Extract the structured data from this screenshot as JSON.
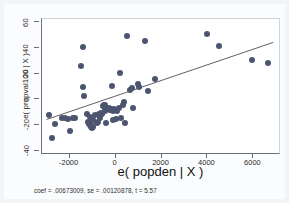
{
  "chart_data": {
    "type": "scatter",
    "title": "",
    "subtitle": "",
    "xlabel": "e( popden | X )",
    "ylabel": "e( propval100 | X )",
    "caption": "coef = .00673009, se = .00120878, t = 5.57",
    "xlim": [
      -3200,
      7200
    ],
    "ylim": [
      -43,
      63
    ],
    "xticks": [
      -2000,
      0,
      2000,
      4000,
      6000
    ],
    "xtick_labels": [
      "-2000",
      "0",
      "2000",
      "4000",
      "6000"
    ],
    "yticks": [
      -40,
      -20,
      0,
      20,
      40,
      60
    ],
    "ytick_labels": [
      "-40",
      "-20",
      "0",
      "20",
      "40",
      "60"
    ],
    "grid": false,
    "legend": null,
    "marker_color": "#4c5570",
    "line_color": "#4a4a52",
    "background_color": "#ffffff",
    "page_color": "#f2f5f8",
    "fit_line": {
      "type": "linear",
      "slope": 0.00673009,
      "intercept": 0.0,
      "x_start": -3000,
      "x_end": 6950,
      "y_start": -16.5,
      "y_end": 44.5
    },
    "regression": {
      "coef": ".00673009",
      "se": ".00120878",
      "t": "5.57"
    },
    "points": [
      [
        -2900,
        -12
      ],
      [
        -2780,
        -30
      ],
      [
        -2620,
        -19
      ],
      [
        -2320,
        -14
      ],
      [
        -2220,
        -14
      ],
      [
        -2060,
        -15
      ],
      [
        -1960,
        -24
      ],
      [
        -1860,
        -14
      ],
      [
        -1780,
        -14
      ],
      [
        -1520,
        26
      ],
      [
        -1420,
        41
      ],
      [
        -1400,
        10
      ],
      [
        -1380,
        3
      ],
      [
        -1260,
        -11
      ],
      [
        -1180,
        -17
      ],
      [
        -1160,
        -19
      ],
      [
        -1120,
        -13
      ],
      [
        -1100,
        -20
      ],
      [
        -1080,
        -21
      ],
      [
        -1060,
        -20
      ],
      [
        -1030,
        -22
      ],
      [
        -1000,
        -21
      ],
      [
        -980,
        -16
      ],
      [
        -900,
        -12
      ],
      [
        -820,
        -18
      ],
      [
        -760,
        -17
      ],
      [
        -700,
        -11
      ],
      [
        -660,
        -14
      ],
      [
        -620,
        -10
      ],
      [
        -580,
        -11
      ],
      [
        -540,
        -5
      ],
      [
        -500,
        -4
      ],
      [
        -480,
        -6
      ],
      [
        -460,
        -4
      ],
      [
        -440,
        -9
      ],
      [
        -400,
        -18
      ],
      [
        -340,
        -7
      ],
      [
        -300,
        -6
      ],
      [
        -260,
        -8
      ],
      [
        -180,
        -7
      ],
      [
        -160,
        11
      ],
      [
        -120,
        -16
      ],
      [
        -100,
        -9
      ],
      [
        -60,
        -7
      ],
      [
        0,
        -15
      ],
      [
        60,
        -9
      ],
      [
        140,
        -6
      ],
      [
        180,
        21
      ],
      [
        240,
        -14
      ],
      [
        320,
        -4
      ],
      [
        360,
        -2
      ],
      [
        420,
        -18
      ],
      [
        520,
        50
      ],
      [
        620,
        8
      ],
      [
        700,
        9
      ],
      [
        760,
        -6
      ],
      [
        980,
        12
      ],
      [
        1020,
        10
      ],
      [
        1300,
        46
      ],
      [
        1420,
        7
      ],
      [
        1700,
        16
      ],
      [
        3980,
        51
      ],
      [
        4520,
        42
      ],
      [
        5940,
        31
      ],
      [
        6640,
        29
      ]
    ]
  }
}
